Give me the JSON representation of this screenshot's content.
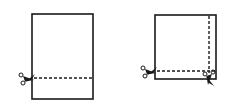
{
  "diagram": {
    "title": "",
    "panels": [
      {
        "id": "single-cut",
        "shape": "tall-rectangle",
        "cuts": [
          "horizontal"
        ]
      },
      {
        "id": "double-cut",
        "shape": "square",
        "cuts": [
          "horizontal",
          "vertical"
        ]
      }
    ],
    "colors": {
      "stroke": "#1a1a1a",
      "background": "#ffffff"
    },
    "icons": [
      "scissors-icon"
    ]
  }
}
